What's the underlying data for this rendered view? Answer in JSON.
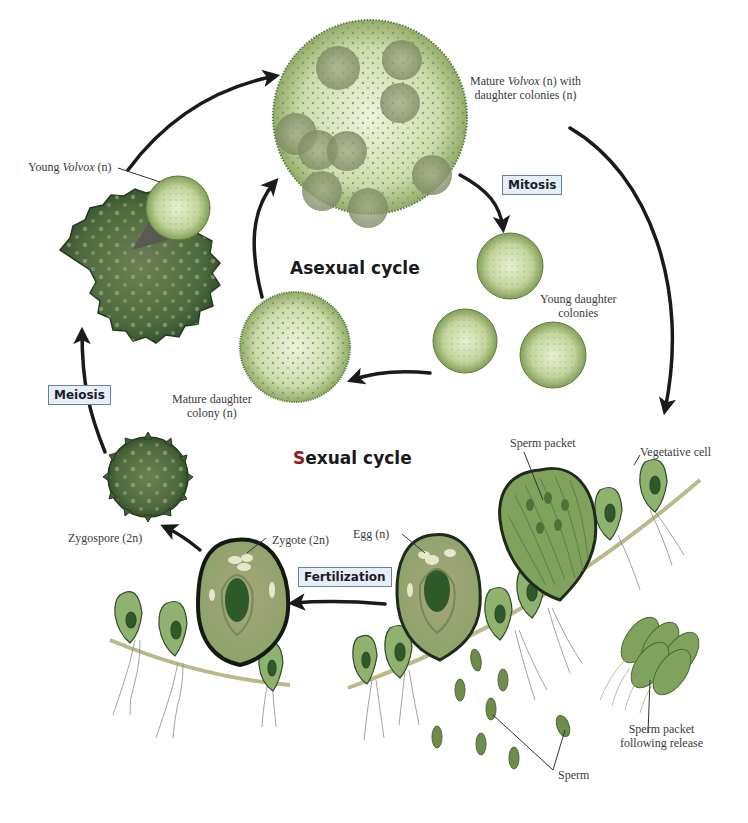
{
  "diagram": {
    "cycles": {
      "asexual": {
        "title": "Asexual cycle"
      },
      "sexual": {
        "title_first_letter": "S",
        "title_rest": "exual cycle"
      }
    },
    "processes": {
      "mitosis": "Mitosis",
      "meiosis": "Meiosis",
      "fertilization": "Fertilization"
    },
    "labels": {
      "young_volvox": {
        "pre": "Young ",
        "italic": "Volvox",
        "post": " (n)"
      },
      "mature_volvox": {
        "line1_pre": "Mature ",
        "line1_italic": "Volvox",
        "line1_post": " (n) with",
        "line2": "daughter colonies (n)"
      },
      "young_daughter_colonies": {
        "line1": "Young daughter",
        "line2": "colonies"
      },
      "mature_daughter_colony": {
        "line1": "Mature daughter",
        "line2": "colony (n)"
      },
      "zygospore": "Zygospore (2n)",
      "zygote": "Zygote (2n)",
      "egg": "Egg (n)",
      "sperm_packet": "Sperm packet",
      "vegetative_cell": "Vegetative cell",
      "sperm_packet_released": {
        "line1": "Sperm packet",
        "line2": "following release"
      },
      "sperm": "Sperm"
    },
    "colors": {
      "colony_light": "#dfe9c4",
      "colony_mid": "#a9c27f",
      "colony_dark": "#5f7f3a",
      "zygospore_dark": "#3f5f35",
      "cell_fill": "#7fa35c",
      "cell_inner": "#b9a980",
      "nucleus": "#2e5a2a",
      "filament": "#b9b98a",
      "arrow": "#1a1a1a",
      "process_box_bg": "#e6eef8",
      "process_box_border": "#6b7f99"
    }
  }
}
